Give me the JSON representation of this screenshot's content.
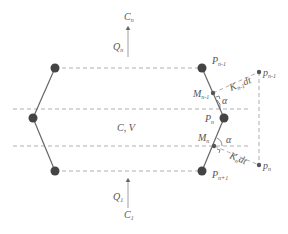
{
  "diagram": {
    "colors": {
      "line": "#666666",
      "dashed": "#999999",
      "node": "#444444",
      "text": "#555555",
      "background": "#ffffff"
    },
    "labels": {
      "top_flow_C": "C",
      "top_flow_C_sub": "n",
      "top_flow_Q": "Q",
      "top_flow_Q_sub": "n",
      "bottom_flow_Q": "Q",
      "bottom_flow_Q_sub": "1",
      "bottom_flow_C": "C",
      "bottom_flow_C_sub": "1",
      "center": "C, V",
      "P_n_minus_1": "P",
      "P_n_minus_1_sub": "n-1",
      "P_n": "P",
      "P_n_sub": "n",
      "P_n_plus_1": "P",
      "P_n_plus_1_sub": "n+1",
      "M_n_minus_1": "M",
      "M_n_minus_1_sub": "n-1",
      "M_n": "M",
      "M_n_sub": "n",
      "p_n_minus_1": "p",
      "p_n_minus_1_sub": "n-1",
      "p_n": "p",
      "p_n_sub": "n",
      "K_upper": "K",
      "K_upper_sub": "n-1",
      "K_upper_suffix": "dt",
      "K_lower": "K",
      "K_lower_sub": "n",
      "K_lower_suffix": "dt",
      "alpha_upper": "α",
      "alpha_lower": "α"
    },
    "nodes": [
      {
        "id": "top-left",
        "x": 55,
        "y": 68
      },
      {
        "id": "P_n-1",
        "x": 202,
        "y": 68
      },
      {
        "id": "left",
        "x": 33,
        "y": 118
      },
      {
        "id": "P_n",
        "x": 224,
        "y": 118
      },
      {
        "id": "bottom-left",
        "x": 55,
        "y": 171
      },
      {
        "id": "P_n+1",
        "x": 202,
        "y": 171
      }
    ]
  }
}
